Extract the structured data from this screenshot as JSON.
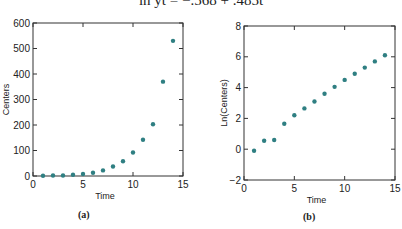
{
  "equation": "ln ŷt = −.568 + .485t",
  "dot_color": "#2f7f82",
  "chart_data": [
    {
      "type": "scatter",
      "panel_label": "(a)",
      "title": "",
      "xlabel": "Time",
      "ylabel": "Centers",
      "xlim": [
        0,
        15
      ],
      "ylim": [
        0,
        600
      ],
      "xticks": [
        0,
        5,
        10,
        15
      ],
      "yticks": [
        0,
        100,
        200,
        300,
        400,
        500,
        600
      ],
      "grid": false,
      "x": [
        1,
        2,
        3,
        4,
        5,
        6,
        7,
        8,
        9,
        10,
        11,
        12,
        13,
        14
      ],
      "y": [
        1,
        2,
        2,
        5,
        8,
        13,
        22,
        37,
        58,
        92,
        142,
        203,
        370,
        530
      ]
    },
    {
      "type": "scatter",
      "panel_label": "(b)",
      "title": "",
      "xlabel": "Time",
      "ylabel": "Ln(Centers)",
      "xlim": [
        0,
        15
      ],
      "ylim": [
        -2,
        8
      ],
      "xticks": [
        0,
        5,
        10,
        15
      ],
      "yticks": [
        -2,
        0,
        2,
        4,
        6,
        8
      ],
      "grid": false,
      "x": [
        1,
        2,
        3,
        4,
        5,
        6,
        7,
        8,
        9,
        10,
        11,
        12,
        13,
        14
      ],
      "y": [
        -0.1,
        0.55,
        0.6,
        1.65,
        2.2,
        2.65,
        3.1,
        3.6,
        4.05,
        4.5,
        4.9,
        5.3,
        5.7,
        6.1
      ]
    }
  ]
}
